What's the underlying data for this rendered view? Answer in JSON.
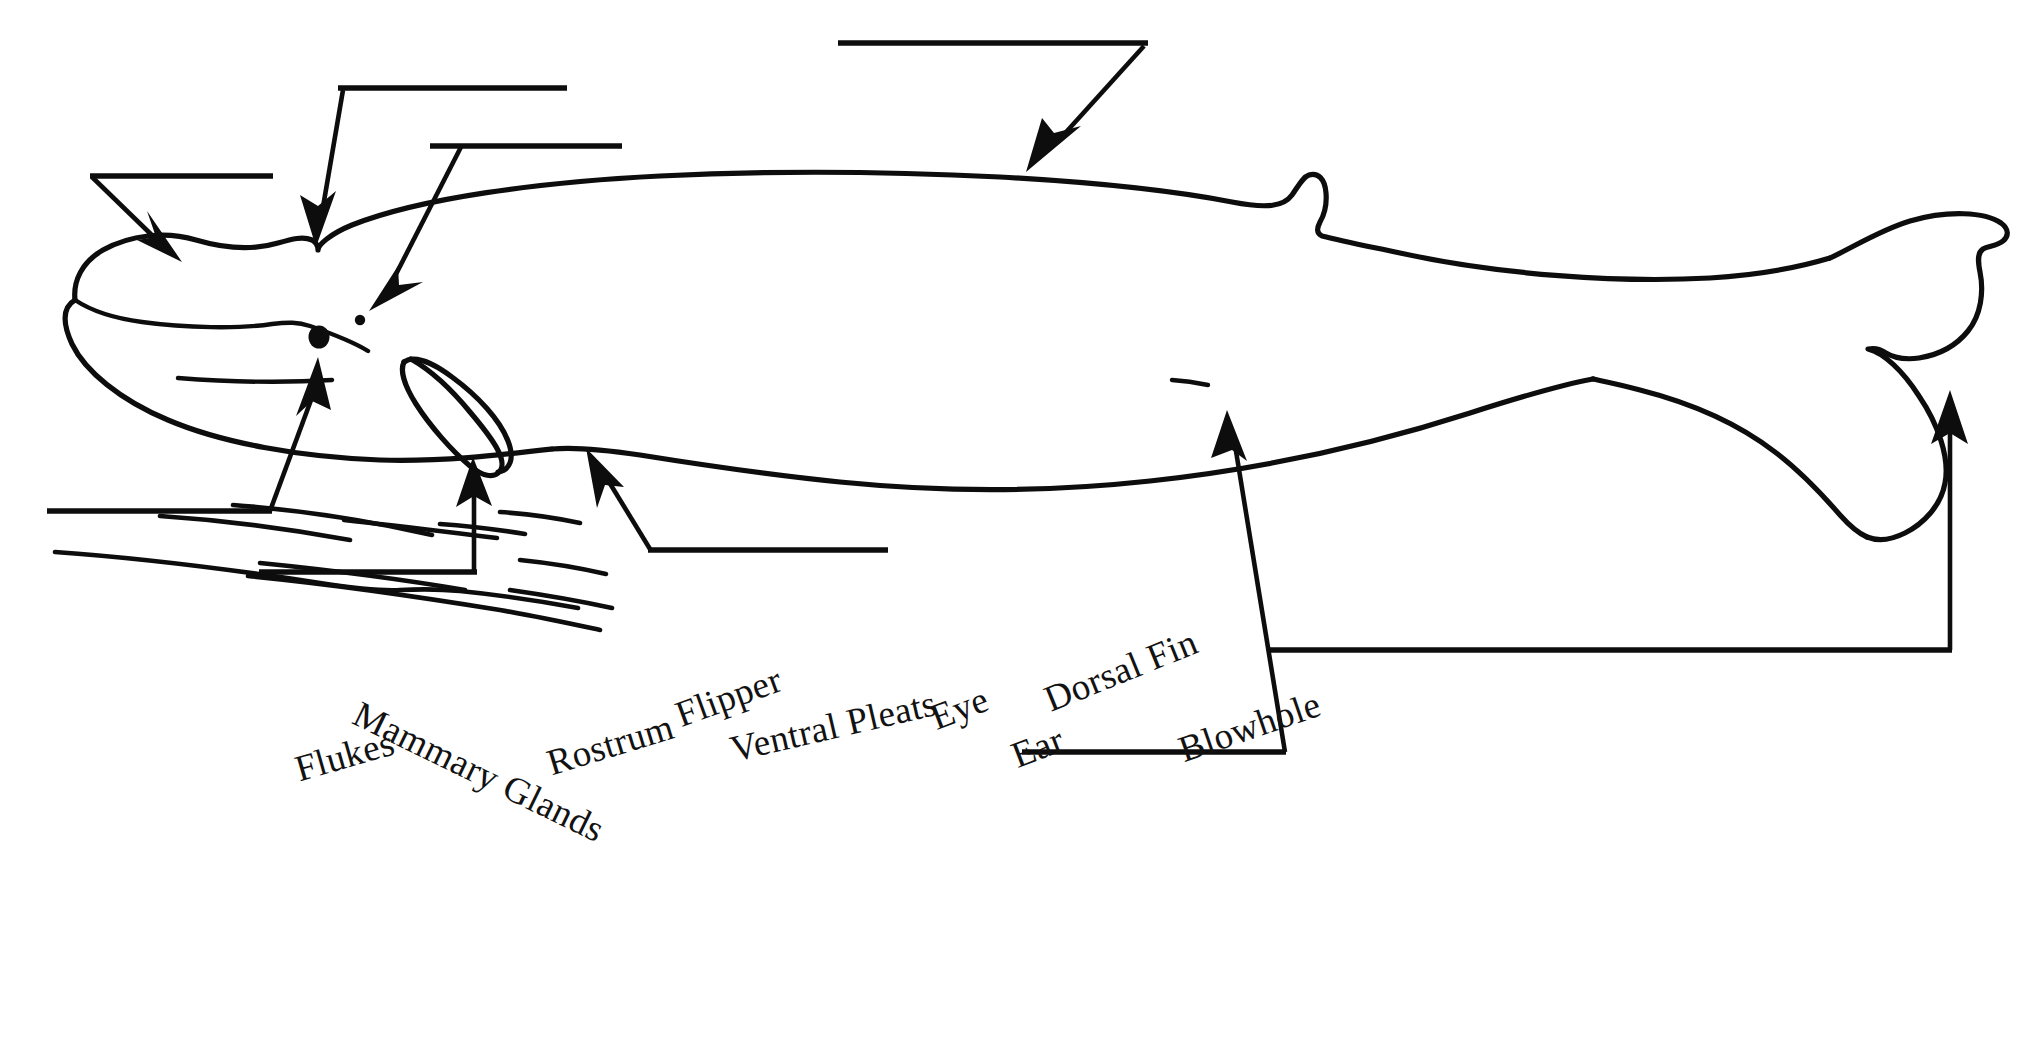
{
  "page": {
    "background_color": "#ffffff",
    "ink_color": "#0d0d0d",
    "width": 2023,
    "height": 1045
  },
  "diagram": {
    "name": "whale-outline"
  },
  "word_bank": {
    "name": "word-bank",
    "terms": [
      {
        "label": "Flukes",
        "x": 296,
        "y": 748,
        "rotate": -16
      },
      {
        "label": "Mammary Glands",
        "x": 356,
        "y": 690,
        "rotate": 26
      },
      {
        "label": "Rostrum",
        "x": 548,
        "y": 742,
        "rotate": -17
      },
      {
        "label": "Flipper",
        "x": 677,
        "y": 694,
        "rotate": -20
      },
      {
        "label": "Ventral Pleats",
        "x": 731,
        "y": 728,
        "rotate": -13
      },
      {
        "label": "Eye",
        "x": 932,
        "y": 697,
        "rotate": -21
      },
      {
        "label": "Ear",
        "x": 1013,
        "y": 735,
        "rotate": -21
      },
      {
        "label": "Dorsal Fin",
        "x": 1046,
        "y": 679,
        "rotate": -22
      },
      {
        "label": "Blowhole",
        "x": 1180,
        "y": 729,
        "rotate": -19
      }
    ]
  },
  "answer_blanks": [
    {
      "name": "answer-blank-rostrum",
      "points_at": "rostrum"
    },
    {
      "name": "answer-blank-blowhole",
      "points_at": "blowhole"
    },
    {
      "name": "answer-blank-eye",
      "points_at": "eye"
    },
    {
      "name": "answer-blank-dorsal-fin",
      "points_at": "dorsal-fin"
    },
    {
      "name": "answer-blank-ear",
      "points_at": "ear"
    },
    {
      "name": "answer-blank-flipper",
      "points_at": "flipper"
    },
    {
      "name": "answer-blank-ventral-pleats",
      "points_at": "ventral-pleats"
    },
    {
      "name": "answer-blank-mammary-glands",
      "points_at": "mammary-glands"
    },
    {
      "name": "answer-blank-flukes",
      "points_at": "flukes"
    }
  ]
}
